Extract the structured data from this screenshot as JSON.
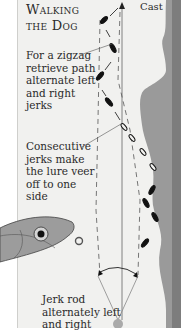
{
  "title": {
    "line1": "Walking",
    "line2": "the Dog"
  },
  "labels": {
    "cast": "Cast",
    "zigzag_note": "For a zigzag retrieve path alternate left and right jerks",
    "consecutive_note": "Consecutive jerks make the lure veer off to one side",
    "rod_note": "Jerk rod alternately left and right"
  },
  "icons": {
    "lure": "fish-lure-icon",
    "arrows": "lure-path-arrow-icon",
    "arc": "rod-swing-arc-icon"
  },
  "colors": {
    "panel_bg": "#f1f1ef",
    "shore": "#8f8f8f",
    "text": "#2a2a2a",
    "lure": "#111111"
  }
}
